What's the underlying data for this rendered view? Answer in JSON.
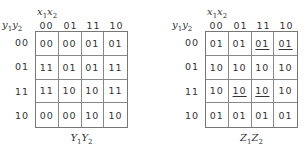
{
  "maps": [
    {
      "id": "next-state",
      "column_var": "x1x2",
      "row_var": "y1y2",
      "caption": "Y1Y2",
      "column_headers": [
        "00",
        "01",
        "11",
        "10"
      ],
      "row_headers": [
        "00",
        "01",
        "11",
        "10"
      ],
      "cells": [
        [
          {
            "v": "00",
            "u": false
          },
          {
            "v": "00",
            "u": false
          },
          {
            "v": "01",
            "u": false
          },
          {
            "v": "01",
            "u": false
          }
        ],
        [
          {
            "v": "11",
            "u": false
          },
          {
            "v": "01",
            "u": false
          },
          {
            "v": "01",
            "u": false
          },
          {
            "v": "11",
            "u": false
          }
        ],
        [
          {
            "v": "11",
            "u": false
          },
          {
            "v": "10",
            "u": false
          },
          {
            "v": "10",
            "u": false
          },
          {
            "v": "11",
            "u": false
          }
        ],
        [
          {
            "v": "00",
            "u": false
          },
          {
            "v": "00",
            "u": false
          },
          {
            "v": "10",
            "u": false
          },
          {
            "v": "10",
            "u": false
          }
        ]
      ]
    },
    {
      "id": "output",
      "column_var": "x1x2",
      "row_var": "y1y2",
      "caption": "Z1Z2",
      "column_headers": [
        "00",
        "01",
        "11",
        "10"
      ],
      "row_headers": [
        "00",
        "01",
        "11",
        "10"
      ],
      "cells": [
        [
          {
            "v": "01",
            "u": false
          },
          {
            "v": "01",
            "u": false
          },
          {
            "v": "01",
            "u": true
          },
          {
            "v": "01",
            "u": true
          }
        ],
        [
          {
            "v": "10",
            "u": false
          },
          {
            "v": "10",
            "u": false
          },
          {
            "v": "10",
            "u": false
          },
          {
            "v": "10",
            "u": false
          }
        ],
        [
          {
            "v": "10",
            "u": false
          },
          {
            "v": "10",
            "u": true
          },
          {
            "v": "10",
            "u": true
          },
          {
            "v": "10",
            "u": false
          }
        ],
        [
          {
            "v": "01",
            "u": false
          },
          {
            "v": "01",
            "u": false
          },
          {
            "v": "01",
            "u": false
          },
          {
            "v": "01",
            "u": false
          }
        ]
      ]
    }
  ]
}
